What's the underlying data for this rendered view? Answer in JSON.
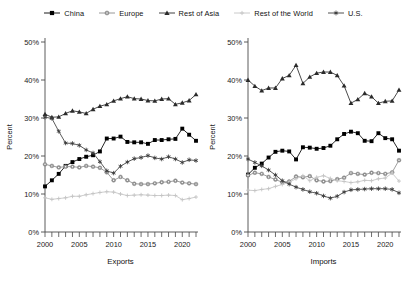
{
  "legend": {
    "items": [
      {
        "label": "China",
        "marker": "square-marker",
        "color": "#000000"
      },
      {
        "label": "Europe",
        "marker": "circle-marker",
        "color": "#8c8c8c"
      },
      {
        "label": "Rest of Asia",
        "marker": "triangle-marker",
        "color": "#2b2b2b"
      },
      {
        "label": "Rest of the World",
        "marker": "plus-marker",
        "color": "#c4c4c4"
      },
      {
        "label": "U.S.",
        "marker": "star-marker",
        "color": "#3d3d3d"
      }
    ]
  },
  "axes": {
    "ylabel": "Percent",
    "yticks": [
      "0%",
      "10%",
      "20%",
      "30%",
      "40%",
      "50%"
    ],
    "ytick_values": [
      0,
      10,
      20,
      30,
      40,
      50
    ],
    "xticks": [
      "2000",
      "2005",
      "2010",
      "2015",
      "2020"
    ],
    "xtick_values": [
      2000,
      2005,
      2010,
      2015,
      2020
    ]
  },
  "chart_data": [
    {
      "type": "line",
      "title": "",
      "xlabel": "Exports",
      "ylabel": "Percent",
      "xlim": [
        2000,
        2022
      ],
      "ylim": [
        0,
        50
      ],
      "grid": false,
      "legend_position": "top",
      "x": [
        2000,
        2001,
        2002,
        2003,
        2004,
        2005,
        2006,
        2007,
        2008,
        2009,
        2010,
        2011,
        2012,
        2013,
        2014,
        2015,
        2016,
        2017,
        2018,
        2019,
        2020,
        2021,
        2022
      ],
      "series": [
        {
          "name": "China",
          "marker": "square-marker",
          "color": "#000000",
          "values": [
            12.0,
            13.6,
            15.3,
            17.4,
            18.4,
            19.2,
            19.8,
            20.2,
            21.2,
            24.6,
            24.6,
            25.1,
            23.7,
            23.6,
            23.6,
            23.2,
            24.2,
            24.2,
            24.4,
            24.5,
            27.2,
            25.6,
            24.0
          ]
        },
        {
          "name": "Europe",
          "marker": "circle-marker",
          "color": "#8c8c8c",
          "values": [
            17.8,
            17.4,
            17.0,
            17.2,
            17.2,
            17.0,
            17.4,
            17.2,
            16.9,
            15.7,
            13.6,
            14.5,
            13.6,
            12.7,
            12.6,
            12.6,
            12.8,
            13.1,
            13.2,
            13.5,
            13.0,
            12.8,
            12.6
          ]
        },
        {
          "name": "Rest of Asia",
          "marker": "triangle-marker",
          "color": "#2b2b2b",
          "values": [
            31.0,
            30.2,
            30.3,
            31.2,
            31.9,
            31.6,
            31.2,
            32.3,
            33.1,
            33.6,
            34.5,
            35.1,
            35.6,
            35.1,
            35.0,
            34.6,
            34.5,
            35.0,
            35.1,
            33.6,
            34.0,
            34.6,
            36.2
          ]
        },
        {
          "name": "Rest of the World",
          "marker": "plus-marker",
          "color": "#c4c4c4",
          "values": [
            9.0,
            8.6,
            8.8,
            9.0,
            9.4,
            9.4,
            9.8,
            10.1,
            10.4,
            10.6,
            10.5,
            10.0,
            9.6,
            9.7,
            9.8,
            9.7,
            9.6,
            9.6,
            9.7,
            9.6,
            8.5,
            8.8,
            9.2
          ]
        },
        {
          "name": "U.S.",
          "marker": "star-marker",
          "color": "#3d3d3d",
          "values": [
            30.2,
            29.9,
            26.5,
            23.4,
            23.3,
            22.8,
            21.6,
            20.8,
            18.5,
            16.1,
            15.5,
            17.3,
            18.4,
            19.3,
            19.6,
            20.1,
            19.5,
            19.2,
            19.8,
            19.2,
            18.3,
            19.0,
            18.8
          ]
        }
      ]
    },
    {
      "type": "line",
      "title": "",
      "xlabel": "Imports",
      "ylabel": "Percent",
      "xlim": [
        2000,
        2022
      ],
      "ylim": [
        0,
        50
      ],
      "grid": false,
      "legend_position": "top",
      "x": [
        2000,
        2001,
        2002,
        2003,
        2004,
        2005,
        2006,
        2007,
        2008,
        2009,
        2010,
        2011,
        2012,
        2013,
        2014,
        2015,
        2016,
        2017,
        2018,
        2019,
        2020,
        2021,
        2022
      ],
      "series": [
        {
          "name": "China",
          "marker": "square-marker",
          "color": "#000000",
          "values": [
            15.1,
            16.9,
            18.0,
            19.6,
            21.1,
            21.4,
            21.2,
            19.1,
            22.3,
            22.2,
            21.9,
            22.1,
            22.7,
            24.4,
            25.8,
            26.4,
            26.0,
            24.0,
            23.9,
            26.0,
            24.7,
            24.4,
            21.4
          ]
        },
        {
          "name": "Europe",
          "marker": "circle-marker",
          "color": "#8c8c8c",
          "values": [
            14.9,
            15.6,
            15.3,
            14.5,
            13.8,
            13.1,
            13.3,
            14.6,
            14.4,
            14.7,
            13.6,
            13.3,
            13.4,
            13.9,
            14.3,
            15.5,
            15.3,
            15.1,
            15.6,
            15.5,
            15.3,
            15.7,
            18.9
          ]
        },
        {
          "name": "Rest of Asia",
          "marker": "triangle-marker",
          "color": "#2b2b2b",
          "values": [
            40.0,
            38.4,
            37.2,
            37.9,
            37.9,
            40.4,
            41.2,
            43.9,
            39.1,
            40.8,
            41.8,
            42.1,
            42.1,
            41.2,
            38.5,
            33.9,
            34.9,
            36.5,
            35.6,
            33.9,
            34.4,
            34.5,
            37.4
          ]
        },
        {
          "name": "Rest of the World",
          "marker": "plus-marker",
          "color": "#c4c4c4",
          "values": [
            11.0,
            10.9,
            11.2,
            11.4,
            12.0,
            12.5,
            13.1,
            14.0,
            14.8,
            13.5,
            14.4,
            14.8,
            14.1,
            13.5,
            13.3,
            13.0,
            13.2,
            13.6,
            13.5,
            14.0,
            14.2,
            15.5,
            13.4
          ]
        },
        {
          "name": "U.S.",
          "marker": "star-marker",
          "color": "#3d3d3d",
          "values": [
            19.2,
            18.3,
            17.4,
            16.3,
            15.0,
            13.5,
            12.6,
            11.8,
            11.2,
            10.6,
            10.2,
            9.5,
            8.9,
            9.4,
            10.5,
            11.1,
            11.2,
            11.3,
            11.4,
            11.4,
            11.4,
            11.2,
            10.3
          ]
        }
      ]
    }
  ]
}
